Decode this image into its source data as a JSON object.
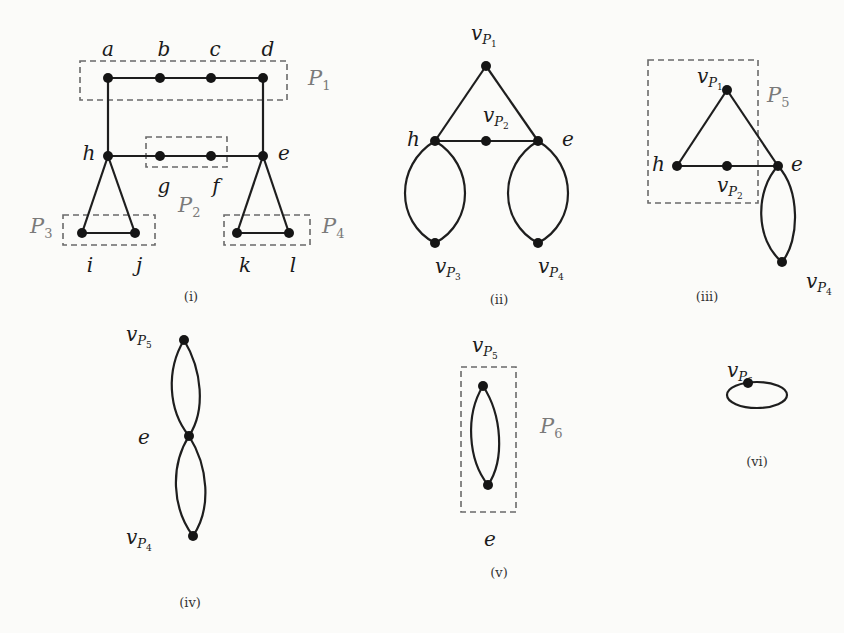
{
  "panels": [
    {
      "caption": "(i)",
      "vertices": [
        "a",
        "b",
        "c",
        "d",
        "h",
        "g",
        "f",
        "e",
        "i",
        "j",
        "k",
        "l"
      ],
      "groups": [
        {
          "name": "P",
          "sub": "1"
        },
        {
          "name": "P",
          "sub": "2"
        },
        {
          "name": "P",
          "sub": "3"
        },
        {
          "name": "P",
          "sub": "4"
        }
      ]
    },
    {
      "caption": "(ii)",
      "vertices": [
        {
          "name": "v",
          "sub": "P",
          "subsub": "1"
        },
        {
          "name": "v",
          "sub": "P",
          "subsub": "2"
        },
        {
          "name": "h"
        },
        {
          "name": "e"
        },
        {
          "name": "v",
          "sub": "P",
          "subsub": "3"
        },
        {
          "name": "v",
          "sub": "P",
          "subsub": "4"
        }
      ]
    },
    {
      "caption": "(iii)",
      "vertices": [
        {
          "name": "v",
          "sub": "P",
          "subsub": "1"
        },
        {
          "name": "h"
        },
        {
          "name": "v",
          "sub": "P",
          "subsub": "2"
        },
        {
          "name": "e"
        },
        {
          "name": "v",
          "sub": "P",
          "subsub": "4"
        }
      ],
      "groups": [
        {
          "name": "P",
          "sub": "5"
        }
      ]
    },
    {
      "caption": "(iv)",
      "vertices": [
        {
          "name": "v",
          "sub": "P",
          "subsub": "5"
        },
        {
          "name": "e"
        },
        {
          "name": "v",
          "sub": "P",
          "subsub": "4"
        }
      ]
    },
    {
      "caption": "(v)",
      "vertices": [
        {
          "name": "v",
          "sub": "P",
          "subsub": "5"
        },
        {
          "name": "e"
        }
      ],
      "groups": [
        {
          "name": "P",
          "sub": "6"
        }
      ]
    },
    {
      "caption": "(vi)",
      "vertices": [
        {
          "name": "v",
          "sub": "P",
          "subsub": "6"
        }
      ]
    }
  ]
}
